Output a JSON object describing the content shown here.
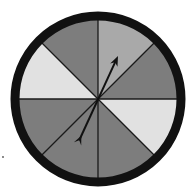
{
  "figure": {
    "center": [
      98,
      99
    ],
    "outer_radius": 87,
    "inner_radius": 79,
    "rim_color": "#111111",
    "divider_color": "#1a1a1a",
    "sections": [
      {
        "index": 0,
        "start_deg": 0,
        "end_deg": 45,
        "shade": "medium-light",
        "color": "#a9a9a9"
      },
      {
        "index": 1,
        "start_deg": 45,
        "end_deg": 90,
        "shade": "dark",
        "color": "#7d7d7d"
      },
      {
        "index": 2,
        "start_deg": 90,
        "end_deg": 135,
        "shade": "light",
        "color": "#e1e1e1"
      },
      {
        "index": 3,
        "start_deg": 135,
        "end_deg": 180,
        "shade": "dark",
        "color": "#7d7d7d"
      },
      {
        "index": 4,
        "start_deg": 180,
        "end_deg": 225,
        "shade": "dark",
        "color": "#7d7d7d"
      },
      {
        "index": 5,
        "start_deg": 225,
        "end_deg": 270,
        "shade": "dark",
        "color": "#7d7d7d"
      },
      {
        "index": 6,
        "start_deg": 270,
        "end_deg": 315,
        "shade": "light",
        "color": "#e1e1e1"
      },
      {
        "index": 7,
        "start_deg": 315,
        "end_deg": 360,
        "shade": "dark",
        "color": "#7d7d7d"
      }
    ],
    "arrow": {
      "tip": [
        118,
        56
      ],
      "tail": [
        78,
        143
      ],
      "color": "#111111",
      "points_to_section": 0
    },
    "speck": [
      3,
      157
    ]
  }
}
